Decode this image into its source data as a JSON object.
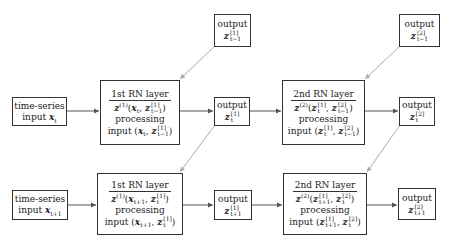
{
  "diagram": {
    "title": "",
    "nodes": {
      "out_prev_1": {
        "label": "output",
        "math": "z_{t-1}^{[1]}"
      },
      "out_prev_2": {
        "label": "output",
        "math": "z_{t-1}^{[2]}"
      },
      "ts_t": {
        "label": "time-series",
        "line2": "input x_t"
      },
      "rn1_t": {
        "title": "1st RN layer",
        "fn": "z^{(1)}(x_t, z_{t-1}^{[1]})",
        "processing": "processing",
        "input": "input (x_t, z_{t-1}^{[1]})"
      },
      "out_t_1": {
        "label": "output",
        "math": "z_t^{[1]}"
      },
      "rn2_t": {
        "title": "2nd RN layer",
        "fn": "z^{(2)}(z_t^{[1]}, z_{t-1}^{[2]})",
        "processing": "processing",
        "input": "input (z_t^{[1]}, z_{t-1}^{[2]})"
      },
      "out_t_2": {
        "label": "output",
        "math": "z_t^{[2]}"
      },
      "ts_t1": {
        "label": "time-series",
        "line2": "input x_{t+1}"
      },
      "rn1_t1": {
        "title": "1st RN layer",
        "fn": "z^{(1)}(x_{t+1}, z_t^{[1]})",
        "processing": "processing",
        "input": "input (x_{t+1}, z_t^{[1]})"
      },
      "out_t1_1": {
        "label": "output",
        "math": "z_{t+1}^{[1]}"
      },
      "rn2_t1": {
        "title": "2nd RN layer",
        "fn": "z^{(2)}(z_{t+1}^{[1]}, z_t^{[2]})",
        "processing": "processing",
        "input": "input (z_{t+1}^{[1]}, z_t^{[2]})"
      },
      "out_t1_2": {
        "label": "output",
        "math": "z_{t+1}^{[2]}"
      }
    },
    "edges": [
      [
        "ts_t",
        "rn1_t"
      ],
      [
        "rn1_t",
        "out_t_1"
      ],
      [
        "out_t_1",
        "rn2_t"
      ],
      [
        "rn2_t",
        "out_t_2"
      ],
      [
        "out_prev_1",
        "rn1_t"
      ],
      [
        "out_prev_2",
        "rn2_t"
      ],
      [
        "out_t_1",
        "rn1_t1"
      ],
      [
        "out_t_2",
        "rn2_t1"
      ],
      [
        "ts_t1",
        "rn1_t1"
      ],
      [
        "rn1_t1",
        "out_t1_1"
      ],
      [
        "out_t1_1",
        "rn2_t1"
      ],
      [
        "rn2_t1",
        "out_t1_2"
      ]
    ],
    "colors": {
      "box_border": "#333333",
      "arrow": "#555555",
      "recurrent_arrow": "#aaaaaa"
    }
  }
}
